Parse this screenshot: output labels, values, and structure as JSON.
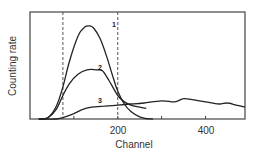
{
  "chart_data": {
    "type": "line",
    "title": "",
    "xlabel": "Channel",
    "ylabel": "Counting rate",
    "xlim": [
      0,
      490
    ],
    "ylim": [
      0,
      100
    ],
    "x_ticks": [
      100,
      200,
      300,
      400
    ],
    "x_tick_labels": [
      "",
      "200",
      "",
      "400"
    ],
    "y_ticks": [],
    "grid": false,
    "legend": "inline curve labels",
    "dashed_vlines": [
      75,
      200
    ],
    "series": [
      {
        "name": "1",
        "label_at": [
          187,
          86
        ],
        "x": [
          20,
          40,
          60,
          75,
          90,
          110,
          125,
          135,
          145,
          160,
          175,
          190,
          200,
          215,
          230,
          250,
          265,
          280
        ],
        "y": [
          0,
          1,
          12,
          30,
          54,
          78,
          86,
          87,
          85,
          75,
          58,
          38,
          26,
          14,
          7,
          2,
          0.5,
          0
        ]
      },
      {
        "name": "2",
        "label_at": [
          155,
          46
        ],
        "x": [
          20,
          40,
          60,
          75,
          90,
          110,
          130,
          150,
          165,
          180,
          200,
          215,
          230,
          250,
          265
        ],
        "y": [
          0,
          1,
          9,
          22,
          33,
          42,
          46,
          46,
          45,
          36,
          22,
          16,
          13,
          11,
          10
        ]
      },
      {
        "name": "3",
        "label_at": [
          155,
          15
        ],
        "x": [
          20,
          60,
          80,
          100,
          120,
          140,
          170,
          200,
          230,
          260,
          300,
          330,
          350,
          370,
          400,
          430,
          450,
          470,
          490
        ],
        "y": [
          0,
          0,
          2,
          5,
          9,
          11,
          12,
          13,
          14,
          15,
          17,
          16,
          19,
          18,
          16,
          14,
          15,
          13,
          11
        ]
      }
    ]
  },
  "labels": {
    "xlabel": "Channel",
    "ylabel": "Counting rate",
    "tick_200": "200",
    "tick_400": "400",
    "curve_1": "1",
    "curve_2": "2",
    "curve_3": "3"
  }
}
